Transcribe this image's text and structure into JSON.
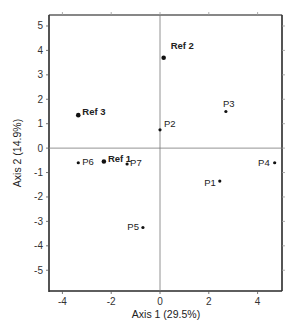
{
  "chart_data": {
    "type": "scatter",
    "title": "",
    "xlabel": "Axis 1 (29.5%)",
    "ylabel": "Axis 2 (14.9%)",
    "xlim": [
      -4.55,
      5.0
    ],
    "ylim": [
      -5.85,
      5.45
    ],
    "xticks": [
      -4,
      -2,
      0,
      2,
      4
    ],
    "yticks": [
      5,
      4,
      3,
      2,
      1,
      0,
      -1,
      -2,
      -3,
      -4,
      -5
    ],
    "grid": false,
    "zero_lines": true,
    "points": [
      {
        "label": "Ref 1",
        "x": -2.3,
        "y": -0.55,
        "ref": true
      },
      {
        "label": "Ref 2",
        "x": 0.15,
        "y": 3.7,
        "ref": true
      },
      {
        "label": "Ref 3",
        "x": -3.35,
        "y": 1.35,
        "ref": true
      },
      {
        "label": "P1",
        "x": 2.45,
        "y": -1.35,
        "ref": false
      },
      {
        "label": "P2",
        "x": 0.0,
        "y": 0.75,
        "ref": false
      },
      {
        "label": "P3",
        "x": 2.7,
        "y": 1.5,
        "ref": false
      },
      {
        "label": "P4",
        "x": 4.7,
        "y": -0.6,
        "ref": false
      },
      {
        "label": "P5",
        "x": -0.7,
        "y": -3.25,
        "ref": false
      },
      {
        "label": "P6",
        "x": -3.35,
        "y": -0.6,
        "ref": false
      },
      {
        "label": "P7",
        "x": -1.35,
        "y": -0.65,
        "ref": false
      }
    ]
  }
}
